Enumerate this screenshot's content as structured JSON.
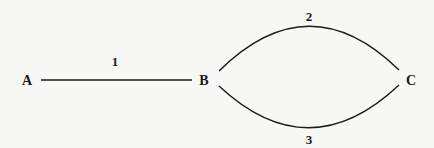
{
  "diagram": {
    "type": "graph",
    "nodes": [
      {
        "id": "A",
        "label": "A"
      },
      {
        "id": "B",
        "label": "B"
      },
      {
        "id": "C",
        "label": "C"
      }
    ],
    "edges": [
      {
        "id": "e1",
        "label": "1",
        "from": "A",
        "to": "B",
        "shape": "straight"
      },
      {
        "id": "e2",
        "label": "2",
        "from": "B",
        "to": "C",
        "shape": "arc-up"
      },
      {
        "id": "e3",
        "label": "3",
        "from": "B",
        "to": "C",
        "shape": "arc-down"
      }
    ],
    "colors": {
      "background": "#f7f7f6",
      "stroke": "#1a1a1a"
    }
  }
}
